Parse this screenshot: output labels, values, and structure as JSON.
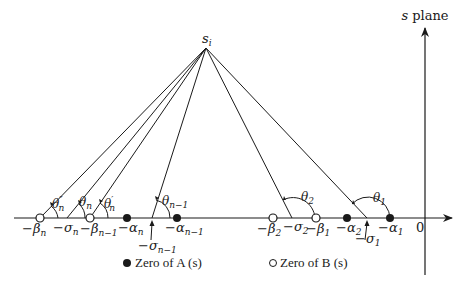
{
  "diagram": {
    "title": "s plane",
    "apex_label": "s",
    "apex_label_sub": "i",
    "origin_label": "0",
    "colors": {
      "ink": "#1a1a1a",
      "background": "#ffffff"
    },
    "b_zeros": [
      {
        "label": "−β",
        "sub": "n"
      },
      {
        "label": "−β",
        "sub": "n−1"
      },
      {
        "label": "−β",
        "sub": "2"
      },
      {
        "label": "−β",
        "sub": "1"
      }
    ],
    "a_zeros": [
      {
        "label": "−α",
        "sub": "n"
      },
      {
        "label": "−α",
        "sub": "n−1"
      },
      {
        "label": "−α",
        "sub": "2"
      },
      {
        "label": "−α",
        "sub": "1"
      }
    ],
    "sigma_points": [
      {
        "label": "−σ",
        "sub": "n"
      },
      {
        "label": "−σ",
        "sub": "n−1"
      },
      {
        "label": "−σ",
        "sub": "2"
      },
      {
        "label": "−σ",
        "sub": "1"
      }
    ],
    "angles": [
      {
        "label": "θ",
        "sub": "n",
        "sup": "″"
      },
      {
        "label": "θ",
        "sub": "n"
      },
      {
        "label": "θ",
        "sub": "n",
        "sup": "′"
      },
      {
        "label": "θ",
        "sub": "n−1"
      },
      {
        "label": "θ",
        "sub": "2"
      },
      {
        "label": "θ",
        "sub": "1"
      }
    ],
    "legend": {
      "a_zero": "Zero of A (s)",
      "b_zero": "Zero of B (s)"
    }
  }
}
